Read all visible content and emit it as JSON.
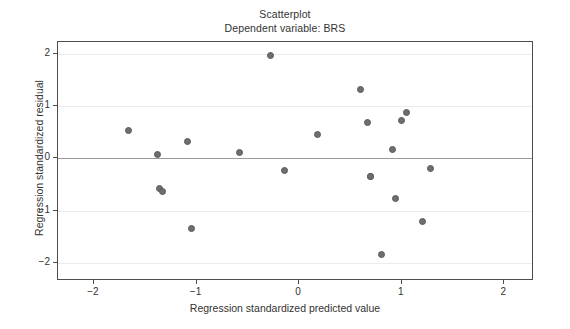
{
  "chart_data": {
    "type": "scatter",
    "title": "Scatterplot",
    "subtitle": "Dependent variable: BRS",
    "xlabel": "Regression standardized predicted value",
    "ylabel": "Regression standardized residual",
    "xlim": [
      -2.35,
      2.27
    ],
    "ylim": [
      -2.3,
      2.22
    ],
    "xticks": [
      -2,
      -1,
      0,
      1,
      2
    ],
    "xtick_labels": [
      "−2",
      "−1",
      "0",
      "1",
      "2"
    ],
    "yticks": [
      -2,
      -1,
      0,
      1,
      2
    ],
    "ytick_labels": [
      "−2",
      "−1",
      "0",
      "1",
      "2"
    ],
    "grid": "horizontal",
    "zero_line": 0,
    "legend": null,
    "marker": {
      "shape": "circle",
      "fill": "#6e6e6e",
      "edge": "#5a5a5a",
      "size_px": 7
    },
    "n_points": 21,
    "points": [
      {
        "x": -1.66,
        "y": 0.53
      },
      {
        "x": -1.38,
        "y": 0.08
      },
      {
        "x": -1.36,
        "y": -0.58
      },
      {
        "x": -1.33,
        "y": -0.63
      },
      {
        "x": -1.09,
        "y": 0.33
      },
      {
        "x": -1.05,
        "y": -1.33
      },
      {
        "x": -0.58,
        "y": 0.12
      },
      {
        "x": -0.28,
        "y": 1.97
      },
      {
        "x": -0.14,
        "y": -0.23
      },
      {
        "x": 0.18,
        "y": 0.46
      },
      {
        "x": 0.6,
        "y": 1.31
      },
      {
        "x": 0.67,
        "y": 0.68
      },
      {
        "x": 0.7,
        "y": -0.35
      },
      {
        "x": 0.8,
        "y": -1.83
      },
      {
        "x": 0.91,
        "y": 0.17
      },
      {
        "x": 0.94,
        "y": -0.77
      },
      {
        "x": 1.0,
        "y": 0.72
      },
      {
        "x": 1.05,
        "y": 0.88
      },
      {
        "x": 1.2,
        "y": -1.2
      },
      {
        "x": 1.28,
        "y": -0.19
      },
      {
        "x": 0.7,
        "y": -0.35
      }
    ],
    "colors": {
      "axis": "#4d4d4d",
      "grid": "#ececec",
      "zero_line": "#9a9a9a",
      "text": "#333333",
      "background": "#ffffff"
    }
  }
}
